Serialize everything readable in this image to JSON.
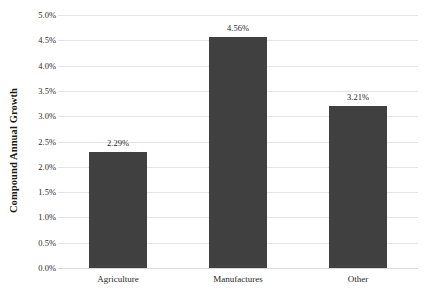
{
  "chart_data": {
    "type": "bar",
    "title": "",
    "xlabel": "",
    "ylabel": "Compound Annual Growth",
    "categories": [
      "Agriculture",
      "Manufactures",
      "Other"
    ],
    "values": [
      2.29,
      4.56,
      3.21
    ],
    "value_labels": [
      "2.29%",
      "4.56%",
      "3.21%"
    ],
    "ylim": [
      0,
      5
    ],
    "ytick_values": [
      0,
      0.5,
      1,
      1.5,
      2,
      2.5,
      3,
      3.5,
      4,
      4.5,
      5
    ],
    "ytick_labels": [
      "0.0%",
      "0.5%",
      "1.0%",
      "1.5%",
      "2.0%",
      "2.5%",
      "3.0%",
      "3.5%",
      "4.0%",
      "4.5%",
      "5.0%"
    ],
    "grid": true,
    "legend": "none",
    "bar_color": "#404040",
    "gridline_color": "#e4e4e4",
    "background_color": "#ffffff"
  }
}
